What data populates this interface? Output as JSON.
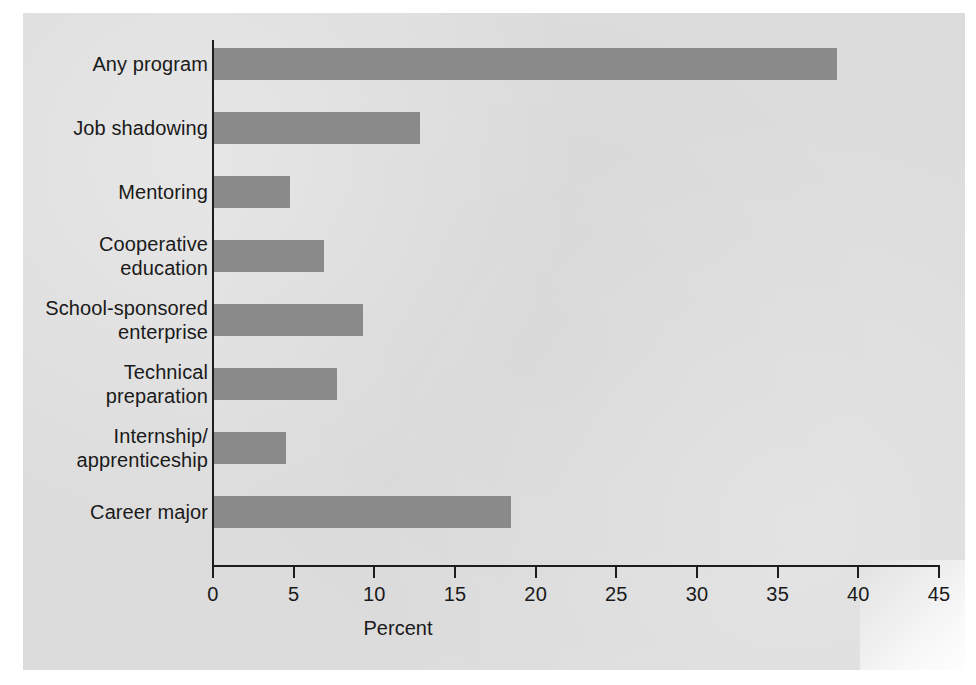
{
  "chart_data": {
    "type": "bar",
    "orientation": "horizontal",
    "title": "",
    "subtitle": "",
    "xlabel": "Percent",
    "ylabel": "",
    "categories": [
      "Any program",
      "Job shadowing",
      "Mentoring",
      "Cooperative education",
      "School-sponsored enterprise",
      "Technical preparation",
      "Internship/ apprenticeship",
      "Career major"
    ],
    "category_lines": [
      [
        "Any program"
      ],
      [
        "Job shadowing"
      ],
      [
        "Mentoring"
      ],
      [
        "Cooperative",
        "education"
      ],
      [
        "School-sponsored",
        "enterprise"
      ],
      [
        "Technical",
        "preparation"
      ],
      [
        "Internship/",
        "apprenticeship"
      ],
      [
        "Career major"
      ]
    ],
    "values": [
      38.7,
      12.8,
      4.8,
      6.9,
      9.3,
      7.7,
      4.5,
      18.5
    ],
    "xlim": [
      0,
      45
    ],
    "xticks": [
      0,
      5,
      10,
      15,
      20,
      25,
      30,
      35,
      40,
      45
    ],
    "xtick_labels": [
      "0",
      "5",
      "10",
      "15",
      "20",
      "25",
      "30",
      "35",
      "40",
      "45"
    ],
    "grid": false,
    "legend": false,
    "bar_color": "#8a8a8a",
    "panel_color": "#dcdcdc",
    "axis_color": "#1d1d1d",
    "text_color": "#1a1a1a"
  }
}
